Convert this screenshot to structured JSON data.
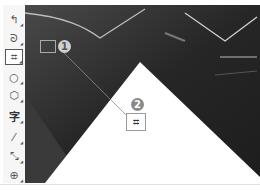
{
  "toolbar": {
    "tools": [
      {
        "name": "line-move-tool",
        "glyph": "↰"
      },
      {
        "name": "lasso-tool",
        "glyph": "ᘐ"
      },
      {
        "name": "crop-tool",
        "glyph": "⌗",
        "selected": true
      },
      {
        "name": "ellipse-tool",
        "glyph": "○"
      },
      {
        "name": "polygon-tool",
        "glyph": "⬡"
      },
      {
        "name": "text-tool",
        "glyph": "字"
      },
      {
        "name": "line-tool",
        "glyph": "⁄"
      },
      {
        "name": "arrow-tool",
        "glyph": "⤡"
      },
      {
        "name": "sticker-tool",
        "glyph": "⊕"
      }
    ]
  },
  "callouts": [
    {
      "number": "1",
      "target": "crop-tool"
    },
    {
      "number": "2",
      "target": "crop-cursor",
      "glyph": "⌗"
    }
  ],
  "colors": {
    "photo_dark": "#2a2a2a",
    "badge": "#8a8a8a",
    "toolbar_bg": "#f6f6f6"
  }
}
